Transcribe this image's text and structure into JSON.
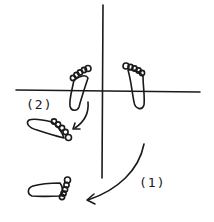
{
  "diagram": {
    "type": "footprint-rotation",
    "axes": {
      "vertical": true,
      "horizontal": true
    },
    "feet": [
      {
        "id": "left-upright",
        "orientation": "toes-up"
      },
      {
        "id": "right-upright",
        "orientation": "toes-up"
      },
      {
        "id": "rotated-2",
        "orientation": "toes-right-down"
      },
      {
        "id": "rotated-1",
        "orientation": "toes-right"
      }
    ],
    "arrows": [
      {
        "id": "arrow-1",
        "label": "(1)"
      },
      {
        "id": "arrow-2",
        "label": "(2)"
      }
    ],
    "labels": {
      "step_1": "(1)",
      "step_2": "(2)"
    },
    "colors": {
      "ink": "#1a1a1a",
      "background": "#ffffff"
    }
  }
}
